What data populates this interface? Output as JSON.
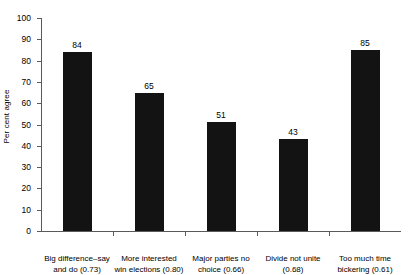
{
  "chart_data": {
    "type": "bar",
    "title": "",
    "xlabel": "",
    "ylabel": "Per cent agree",
    "ylim": [
      0,
      100
    ],
    "ytick_step": 10,
    "grid": false,
    "legend": false,
    "bar_color": "#131313",
    "axis_color": "#5a5a5a",
    "yticks": [
      "0",
      "10",
      "20",
      "30",
      "40",
      "50",
      "60",
      "70",
      "80",
      "90",
      "100"
    ],
    "categories": [
      "Big difference–say\nand do (0.73)",
      "More interested\nwin elections (0.80)",
      "Major parties no\nchoice (0.66)",
      "Divide not unite\n(0.68)",
      "Too much time\nbickering (0.61)"
    ],
    "values": [
      84,
      65,
      51,
      43,
      85
    ],
    "value_labels": [
      "84",
      "65",
      "51",
      "43",
      "85"
    ],
    "loadings": [
      "0.73",
      "0.80",
      "0.66",
      "0.68",
      "0.61"
    ]
  }
}
